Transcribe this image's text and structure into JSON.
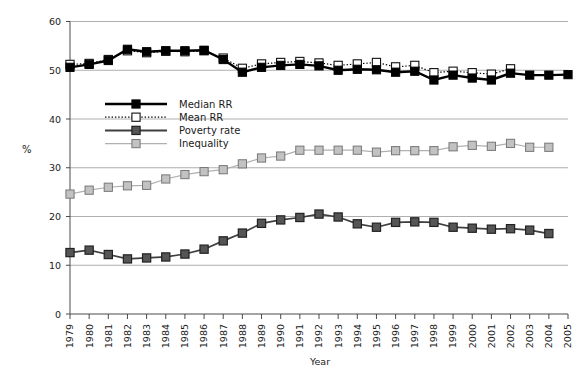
{
  "figure": {
    "clipped_caption_text": "",
    "y_axis_label": "%",
    "x_axis_label": "Year"
  },
  "legend": {
    "items": [
      {
        "label": "Median RR",
        "marker": "filled-square-black",
        "color": "#000000",
        "line": "solid"
      },
      {
        "label": "Mean RR",
        "marker": "open-square-white",
        "color": "#000000",
        "line": "dotted"
      },
      {
        "label": "Poverty rate",
        "marker": "filled-square-dark-gray",
        "color": "#3f3f3f",
        "line": "solid"
      },
      {
        "label": "Inequality",
        "marker": "filled-square-light-gray",
        "color": "#b0b0b0",
        "line": "solid"
      }
    ]
  },
  "chart_data": {
    "type": "line",
    "title": "",
    "xlabel": "Year",
    "ylabel": "%",
    "ylim": [
      0,
      60
    ],
    "yticks": [
      0,
      10,
      20,
      30,
      40,
      50,
      60
    ],
    "grid": true,
    "legend_position": "inside-upper-left",
    "x": [
      1979,
      1980,
      1981,
      1982,
      1983,
      1984,
      1985,
      1986,
      1987,
      1988,
      1989,
      1990,
      1991,
      1992,
      1993,
      1994,
      1995,
      1996,
      1997,
      1998,
      1999,
      2000,
      2001,
      2002,
      2003,
      2004,
      2005
    ],
    "xtick_labels": [
      "1979",
      "1980",
      "1981",
      "1982",
      "1983",
      "1984",
      "1985",
      "1986",
      "1987",
      "1988",
      "1989",
      "1990",
      "1991",
      "1992",
      "1993",
      "1994",
      "1995",
      "1996",
      "1997",
      "1998",
      "1999",
      "2000",
      "2001",
      "2002",
      "2003",
      "2004",
      "2005"
    ],
    "series": [
      {
        "name": "Median RR",
        "color": "#000000",
        "line": "solid",
        "marker": "filled-square-black",
        "values": [
          50.6,
          51.2,
          52.0,
          54.3,
          53.8,
          54.0,
          54.0,
          54.1,
          52.2,
          49.6,
          50.6,
          51.0,
          51.2,
          50.9,
          50.0,
          50.2,
          50.1,
          49.6,
          49.8,
          48.0,
          49.0,
          48.4,
          48.0,
          49.4,
          49.0,
          49.0,
          49.1
        ]
      },
      {
        "name": "Mean RR",
        "color": "#000000",
        "line": "dotted",
        "marker": "open-square-white",
        "values": [
          51.2,
          51.4,
          52.2,
          54.0,
          53.6,
          53.9,
          53.8,
          54.0,
          52.5,
          50.4,
          51.3,
          51.6,
          51.8,
          51.5,
          51.0,
          51.3,
          51.6,
          50.7,
          51.0,
          49.5,
          49.8,
          49.5,
          49.2,
          50.3,
          null,
          null,
          null
        ]
      },
      {
        "name": "Poverty rate",
        "color": "#3f3f3f",
        "line": "solid",
        "marker": "filled-square-dark-gray",
        "values": [
          12.6,
          13.1,
          12.2,
          11.3,
          11.5,
          11.7,
          12.3,
          13.3,
          15.0,
          16.6,
          18.6,
          19.3,
          19.8,
          20.5,
          19.9,
          18.5,
          17.8,
          18.8,
          18.9,
          18.8,
          17.8,
          17.6,
          17.4,
          17.5,
          17.2,
          16.5,
          null
        ]
      },
      {
        "name": "Inequality",
        "color": "#b0b0b0",
        "line": "solid",
        "marker": "filled-square-light-gray",
        "values": [
          24.6,
          25.4,
          26.0,
          26.3,
          26.4,
          27.7,
          28.6,
          29.2,
          29.6,
          30.8,
          32.0,
          32.4,
          33.6,
          33.6,
          33.6,
          33.6,
          33.2,
          33.5,
          33.5,
          33.5,
          34.3,
          34.6,
          34.4,
          35.0,
          34.2,
          34.2,
          null
        ]
      }
    ]
  }
}
